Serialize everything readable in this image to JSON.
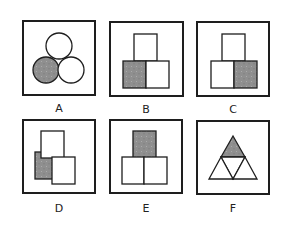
{
  "colors": {
    "stroke": "#1e1e1e",
    "shade": "#8f8f8f",
    "fill": "#ffffff"
  },
  "options": [
    {
      "label": "A",
      "shape": "three-circles",
      "shaded": "bottom-left circle"
    },
    {
      "label": "B",
      "shape": "three-squares-pyramid",
      "shaded": "bottom-left square"
    },
    {
      "label": "C",
      "shape": "three-squares-pyramid",
      "shaded": "bottom-right square"
    },
    {
      "label": "D",
      "shape": "three-squares-offset",
      "shaded": "left square (behind)"
    },
    {
      "label": "E",
      "shape": "three-squares-pyramid",
      "shaded": "top square"
    },
    {
      "label": "F",
      "shape": "four-triangles",
      "shaded": "top triangle"
    }
  ]
}
